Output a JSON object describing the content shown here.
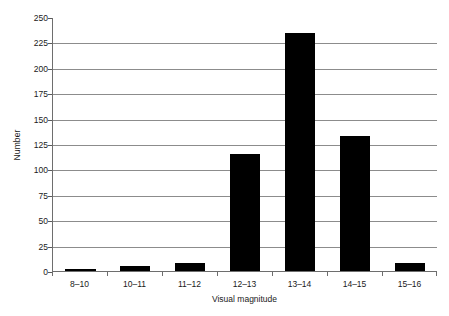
{
  "chart_data": {
    "type": "bar",
    "title": "",
    "subtitle": "",
    "xlabel": "Visual magnitude",
    "ylabel": "Number",
    "categories": [
      "8–10",
      "10–11",
      "11–12",
      "12–13",
      "13–14",
      "14–15",
      "15–16"
    ],
    "values": [
      2,
      5,
      8,
      116,
      235,
      133,
      8
    ],
    "series": [
      {
        "name": "Number",
        "values": [
          2,
          5,
          8,
          116,
          235,
          133,
          8
        ]
      }
    ],
    "ylim": [
      0,
      250
    ],
    "ytick_step": 25,
    "yticks": [
      0,
      25,
      50,
      75,
      100,
      125,
      150,
      175,
      200,
      225,
      250
    ],
    "ytick_labels": [
      "0",
      "25",
      "50",
      "75",
      "100",
      "125",
      "150",
      "175",
      "200",
      "225",
      "250"
    ],
    "grid": "horizontal",
    "legend": "none",
    "bar_color": "#000000",
    "gridline_color": "#8c8c8c",
    "axis_color": "#6e6e6e",
    "background": "#ffffff",
    "annotations": []
  }
}
